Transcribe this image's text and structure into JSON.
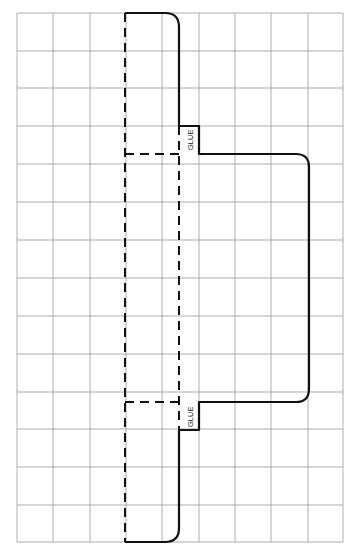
{
  "diagram": {
    "type": "packaging-dieline-template",
    "grid": {
      "columns": 9,
      "rows": 14,
      "x0": 17,
      "y0": 13,
      "x1": 343,
      "y1": 542,
      "line_color": "#9a9a9a"
    },
    "glue_tabs": [
      {
        "label": "GLUE",
        "position": "upper"
      },
      {
        "label": "GLUE",
        "position": "lower"
      }
    ],
    "legend": {
      "cut_line": "solid",
      "fold_line": "dashed"
    },
    "colors": {
      "outline": "#111111",
      "background": "#ffffff"
    }
  }
}
